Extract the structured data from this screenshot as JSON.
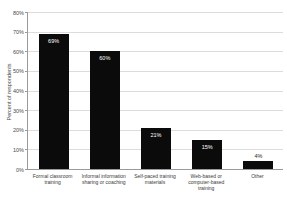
{
  "chart_data": {
    "type": "bar",
    "categories": [
      "Formal classroom training",
      "Informal information sharing or coaching",
      "Self-paced training materials",
      "Web-based or computer-based training",
      "Other"
    ],
    "values": [
      69,
      60,
      21,
      15,
      4
    ],
    "value_labels": [
      "69%",
      "60%",
      "21%",
      "15%",
      "4%"
    ],
    "title": "",
    "xlabel": "",
    "ylabel": "Percent of respondents",
    "ylim": [
      0,
      80
    ],
    "yticks": [
      0,
      10,
      20,
      30,
      40,
      50,
      60,
      70,
      80
    ],
    "ytick_labels": [
      "0%",
      "10%",
      "20%",
      "30%",
      "40%",
      "50%",
      "60%",
      "70%",
      "80%"
    ],
    "grid": true,
    "legend_position": "none",
    "value_label_inside_threshold": 8,
    "colors": {
      "bar": "#0b0b0b",
      "grid": "#dcdcdc",
      "axis": "#9a9a9a",
      "tick_text": "#4a4a4a",
      "value_label_inside": "#ffffff",
      "value_label_outside": "#1f1f1f",
      "background": "#ffffff"
    }
  }
}
